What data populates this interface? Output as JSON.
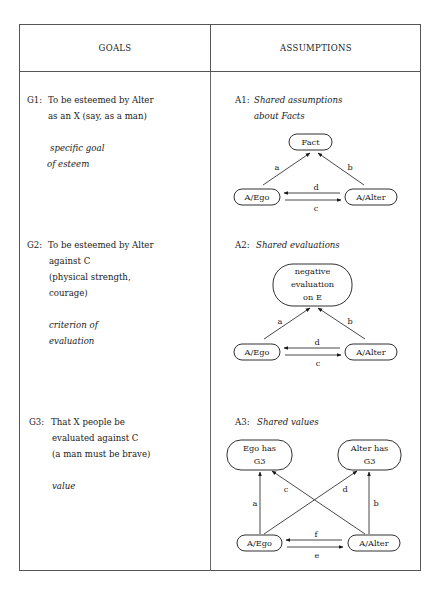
{
  "header": {
    "goals": "GOALS",
    "assumptions": "ASSUMPTIONS"
  },
  "goals": [
    {
      "id": "G1:",
      "lines": [
        "To be esteemed by Alter",
        "as an X (say, as a man)"
      ],
      "note_lines": [
        "specific goal",
        "of esteem"
      ]
    },
    {
      "id": "G2:",
      "lines": [
        "To be esteemed by Alter",
        "against C",
        "(physical strength,",
        "courage)"
      ],
      "note_lines": [
        "criterion of",
        "evaluation"
      ]
    },
    {
      "id": "G3:",
      "lines": [
        "That X people be",
        "evaluated against C",
        "(a man must be brave)"
      ],
      "note_lines": [
        "value"
      ]
    }
  ],
  "assumptions": [
    {
      "id": "A1:",
      "title_lines": [
        "Shared assumptions",
        "about Facts"
      ],
      "nodes": {
        "top": "Fact",
        "ego": "A/Ego",
        "alter": "A/Alter"
      },
      "edges": {
        "a": "a",
        "b": "b",
        "d": "d",
        "c": "c"
      }
    },
    {
      "id": "A2:",
      "title_lines": [
        "Shared evaluations"
      ],
      "nodes": {
        "top_lines": [
          "negative",
          "evaluation",
          "on E"
        ],
        "ego": "A/Ego",
        "alter": "A/Alter"
      },
      "edges": {
        "a": "a",
        "b": "b",
        "d": "d",
        "c": "c"
      }
    },
    {
      "id": "A3:",
      "title_lines": [
        "Shared values"
      ],
      "nodes": {
        "ego_has": [
          "Ego has",
          "G3"
        ],
        "alter_has": [
          "Alter has",
          "G3"
        ],
        "ego": "A/Ego",
        "alter": "A/Alter"
      },
      "edges": {
        "a": "a",
        "b": "b",
        "c": "c",
        "d": "d",
        "f": "f",
        "e": "e"
      }
    }
  ]
}
